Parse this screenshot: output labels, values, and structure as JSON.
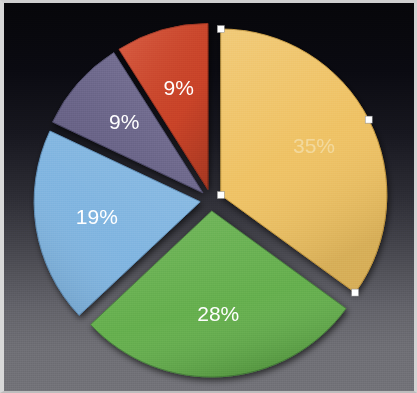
{
  "chart_data": {
    "type": "pie",
    "title": "",
    "subtitle": "",
    "xlabel": "",
    "ylabel": "",
    "legend_position": "none",
    "grid": false,
    "labels_shown_as": "percent",
    "exploded": true,
    "start_angle_deg": 0,
    "direction": "clockwise",
    "categories": [
      "Slice 1",
      "Slice 2",
      "Slice 3",
      "Slice 4",
      "Slice 5"
    ],
    "values": [
      35,
      28,
      19,
      9,
      9
    ],
    "slices": [
      {
        "id": "slice-yellow",
        "label": "35%",
        "value": 35,
        "color": "#efc264",
        "edge_color": "#c79a3f",
        "start_deg": 0,
        "end_deg": 126,
        "selected": true,
        "label_style": "dim"
      },
      {
        "id": "slice-green",
        "label": "28%",
        "value": 28,
        "color": "#63ae4c",
        "edge_color": "#47823a",
        "start_deg": 126,
        "end_deg": 226.8,
        "selected": false,
        "label_style": "bright"
      },
      {
        "id": "slice-blue",
        "label": "19%",
        "value": 19,
        "color": "#7fb4e0",
        "edge_color": "#5d8cb5",
        "start_deg": 226.8,
        "end_deg": 295.2,
        "selected": false,
        "label_style": "bright"
      },
      {
        "id": "slice-purple",
        "label": "9%",
        "value": 9,
        "color": "#6f6a90",
        "edge_color": "#4f4b6b",
        "start_deg": 295.2,
        "end_deg": 327.6,
        "selected": false,
        "label_style": "bright"
      },
      {
        "id": "slice-red",
        "label": "9%",
        "value": 9,
        "color": "#d4472a",
        "edge_color": "#9e3320",
        "start_deg": 327.6,
        "end_deg": 360,
        "selected": false,
        "label_style": "bright"
      }
    ],
    "total": 100,
    "background_top_color": "#060609",
    "background_bottom_color": "#737379",
    "frame_color": "#d8d8d8",
    "selection_handle_color": "#ffffff",
    "selection_handle_count": 4
  }
}
